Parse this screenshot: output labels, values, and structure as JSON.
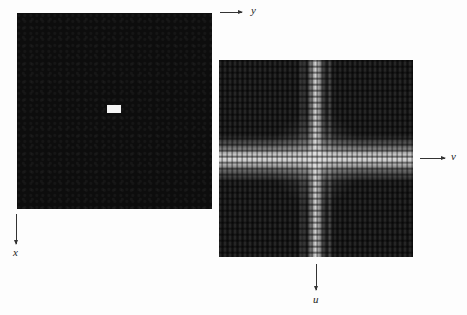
{
  "figure": {
    "left_panel": {
      "description": "Spatial-domain image: small bright rectangle on dark background",
      "background_color": "#0d0d0d",
      "rectangle_color": "#f4f4f4"
    },
    "right_panel": {
      "description": "Fourier spectrum magnitude: bright cross of sinc-like lobes",
      "background_color": "#1a1a1a",
      "bright_color": "#ffffff"
    },
    "axes": {
      "spatial_horizontal": "y",
      "spatial_vertical": "x",
      "frequency_horizontal": "v",
      "frequency_vertical": "u"
    }
  }
}
